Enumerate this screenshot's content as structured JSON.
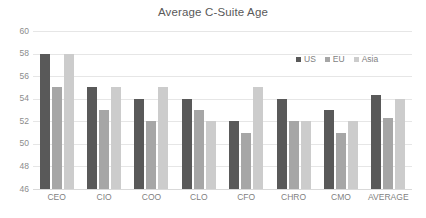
{
  "chart_data": {
    "type": "bar",
    "title": "Average C-Suite Age",
    "xlabel": "",
    "ylabel": "",
    "ylim": [
      46,
      60
    ],
    "ytick_step": 2,
    "yticks": [
      60,
      58,
      56,
      54,
      52,
      50,
      48,
      46
    ],
    "grid": true,
    "legend_position": "top-right",
    "categories": [
      "CEO",
      "CIO",
      "COO",
      "CLO",
      "CFO",
      "CHRO",
      "CMO",
      "AVERAGE"
    ],
    "series": [
      {
        "name": "US",
        "color": "#595959",
        "values": [
          58,
          55,
          54,
          54,
          52,
          54,
          53,
          54.3
        ]
      },
      {
        "name": "EU",
        "color": "#a6a6a6",
        "values": [
          55,
          53,
          52,
          53,
          51,
          52,
          51,
          52.3
        ]
      },
      {
        "name": "Asia",
        "color": "#cccccc",
        "values": [
          58,
          55,
          55,
          52,
          55,
          52,
          52,
          54.0
        ]
      }
    ]
  },
  "colors": {
    "background": "#ffffff",
    "title_text": "#595959",
    "tick_text": "#7f7f7f",
    "ytick_text": "#8c8c8c",
    "gridline": "#e6e6e6",
    "axis_line": "#d9d9d9",
    "series_us": "#595959",
    "series_eu": "#a6a6a6",
    "series_asia": "#cccccc"
  }
}
